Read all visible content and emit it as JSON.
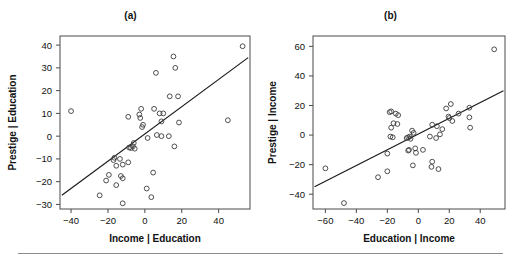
{
  "figure": {
    "width": 521,
    "height": 262,
    "background": "#ffffff",
    "ink_color": "#1a1a1a",
    "point_stroke": "#3b3b3b",
    "frame_color": "#4a4a4a",
    "rule_color": "#8c8c8c"
  },
  "panels": [
    {
      "id": "a",
      "title": "(a)",
      "chart_data": {
        "type": "scatter",
        "title": "(a)",
        "xlabel": "Income | Education",
        "ylabel": "Prestige | Education",
        "xlim": [
          -46,
          57
        ],
        "ylim": [
          -32,
          44
        ],
        "xticks": [
          -40,
          -20,
          0,
          20,
          40
        ],
        "yticks": [
          -30,
          -20,
          -10,
          0,
          10,
          20,
          30,
          40
        ],
        "grid": false,
        "legend": "none",
        "marker": "open-circle",
        "fit_line": {
          "type": "least-squares",
          "x_start": -45,
          "y_start": -26,
          "x_end": 56,
          "y_end": 34.5
        },
        "annotations": [
          {
            "label": "minister",
            "x": -40.0,
            "y": 11.0,
            "text_side": "right"
          },
          {
            "label": "RR engineer",
            "x": 53.0,
            "y": 39.5,
            "text_side": "left"
          },
          {
            "label": "conductor",
            "x": 45.0,
            "y": 7.0,
            "text_side": "below"
          }
        ],
        "points": [
          {
            "x": -40.0,
            "y": 11.0
          },
          {
            "x": 53.0,
            "y": 39.5
          },
          {
            "x": 45.0,
            "y": 7.0
          },
          {
            "x": 15.5,
            "y": 35.0
          },
          {
            "x": 16.5,
            "y": 30.0
          },
          {
            "x": 6.0,
            "y": 27.8
          },
          {
            "x": 13.5,
            "y": 17.5
          },
          {
            "x": 18.0,
            "y": 17.5
          },
          {
            "x": 5.0,
            "y": 12.0
          },
          {
            "x": -2.0,
            "y": 12.0
          },
          {
            "x": -3.0,
            "y": 9.5
          },
          {
            "x": -9.0,
            "y": 8.5
          },
          {
            "x": -2.5,
            "y": 8.0
          },
          {
            "x": 8.0,
            "y": 10.0
          },
          {
            "x": 10.0,
            "y": 10.0
          },
          {
            "x": 9.0,
            "y": 6.5
          },
          {
            "x": 18.5,
            "y": 6.0
          },
          {
            "x": -1.5,
            "y": 4.0
          },
          {
            "x": -1.0,
            "y": 5.0
          },
          {
            "x": 1.5,
            "y": -0.8
          },
          {
            "x": 9.0,
            "y": 0.0
          },
          {
            "x": 13.0,
            "y": 0.0
          },
          {
            "x": 6.5,
            "y": 0.5
          },
          {
            "x": -6.0,
            "y": -3.0
          },
          {
            "x": -6.5,
            "y": -4.5
          },
          {
            "x": -7.5,
            "y": -5.2
          },
          {
            "x": -8.5,
            "y": -5.0
          },
          {
            "x": -5.5,
            "y": -5.5
          },
          {
            "x": 16.0,
            "y": -4.5
          },
          {
            "x": -16.5,
            "y": -9.5
          },
          {
            "x": -17.0,
            "y": -10.5
          },
          {
            "x": -13.5,
            "y": -10.0
          },
          {
            "x": -12.0,
            "y": -12.5
          },
          {
            "x": -9.0,
            "y": -11.5
          },
          {
            "x": -15.5,
            "y": -13.0
          },
          {
            "x": -19.5,
            "y": -17.0
          },
          {
            "x": -21.0,
            "y": -19.5
          },
          {
            "x": -12.0,
            "y": -18.5
          },
          {
            "x": -13.0,
            "y": -17.5
          },
          {
            "x": -15.5,
            "y": -21.5
          },
          {
            "x": -24.5,
            "y": -26.0
          },
          {
            "x": -12.0,
            "y": -29.5
          },
          {
            "x": 4.5,
            "y": -16.0
          },
          {
            "x": 1.0,
            "y": -23.0
          },
          {
            "x": 3.5,
            "y": -26.8
          }
        ]
      }
    },
    {
      "id": "b",
      "title": "(b)",
      "chart_data": {
        "type": "scatter",
        "title": "(b)",
        "xlabel": "Education | Income",
        "ylabel": "Prestige | Income",
        "xlim": [
          -68,
          56
        ],
        "ylim": [
          -50,
          67
        ],
        "xticks": [
          -60,
          -40,
          -20,
          0,
          20,
          40
        ],
        "yticks": [
          -40,
          -20,
          0,
          20,
          40,
          60
        ],
        "grid": false,
        "legend": "none",
        "marker": "open-circle",
        "fit_line": {
          "type": "least-squares",
          "x_start": -67,
          "y_start": -35,
          "x_end": 55,
          "y_end": 30
        },
        "annotations": [
          {
            "label": "minister",
            "x": 49.0,
            "y": 58.0,
            "text_side": "left"
          },
          {
            "label": "RR engineer",
            "x": -20.0,
            "y": -24.5,
            "text_side": "right"
          },
          {
            "label": "conductor",
            "x": -48.0,
            "y": -46.0,
            "text_side": "right"
          }
        ],
        "points": [
          {
            "x": 49.0,
            "y": 58.0
          },
          {
            "x": -20.0,
            "y": -24.5
          },
          {
            "x": -48.0,
            "y": -46.0
          },
          {
            "x": -60.0,
            "y": -22.5
          },
          {
            "x": 21.0,
            "y": 21.0
          },
          {
            "x": -17.5,
            "y": 16.0
          },
          {
            "x": -18.5,
            "y": 15.5
          },
          {
            "x": -14.5,
            "y": 14.5
          },
          {
            "x": -13.0,
            "y": 13.5
          },
          {
            "x": 33.0,
            "y": 18.5
          },
          {
            "x": 18.0,
            "y": 18.0
          },
          {
            "x": 26.0,
            "y": 14.5
          },
          {
            "x": 19.5,
            "y": 12.5
          },
          {
            "x": 20.0,
            "y": 11.5
          },
          {
            "x": 33.0,
            "y": 12.0
          },
          {
            "x": 22.0,
            "y": 9.5
          },
          {
            "x": -16.0,
            "y": 8.0
          },
          {
            "x": -13.5,
            "y": 7.5
          },
          {
            "x": -17.5,
            "y": 5.0
          },
          {
            "x": 9.0,
            "y": 7.0
          },
          {
            "x": 12.0,
            "y": 6.0
          },
          {
            "x": 33.5,
            "y": 5.0
          },
          {
            "x": 15.5,
            "y": 4.0
          },
          {
            "x": -4.0,
            "y": 3.0
          },
          {
            "x": -3.0,
            "y": 1.5
          },
          {
            "x": -18.0,
            "y": -1.0
          },
          {
            "x": -16.5,
            "y": -1.5
          },
          {
            "x": -5.5,
            "y": -1.0
          },
          {
            "x": -6.5,
            "y": -1.5
          },
          {
            "x": -7.5,
            "y": -2.0
          },
          {
            "x": -5.0,
            "y": -2.5
          },
          {
            "x": 11.5,
            "y": -2.0
          },
          {
            "x": 14.0,
            "y": 0.5
          },
          {
            "x": 7.5,
            "y": -1.0
          },
          {
            "x": -6.0,
            "y": -10.0
          },
          {
            "x": -6.5,
            "y": -10.5
          },
          {
            "x": -2.0,
            "y": -9.0
          },
          {
            "x": 3.0,
            "y": -10.0
          },
          {
            "x": -1.5,
            "y": -12.0
          },
          {
            "x": -20.0,
            "y": -12.5
          },
          {
            "x": -3.5,
            "y": -20.5
          },
          {
            "x": 9.0,
            "y": -18.0
          },
          {
            "x": 8.5,
            "y": -21.5
          },
          {
            "x": 13.0,
            "y": -23.0
          },
          {
            "x": -26.0,
            "y": -28.5
          }
        ]
      }
    }
  ]
}
